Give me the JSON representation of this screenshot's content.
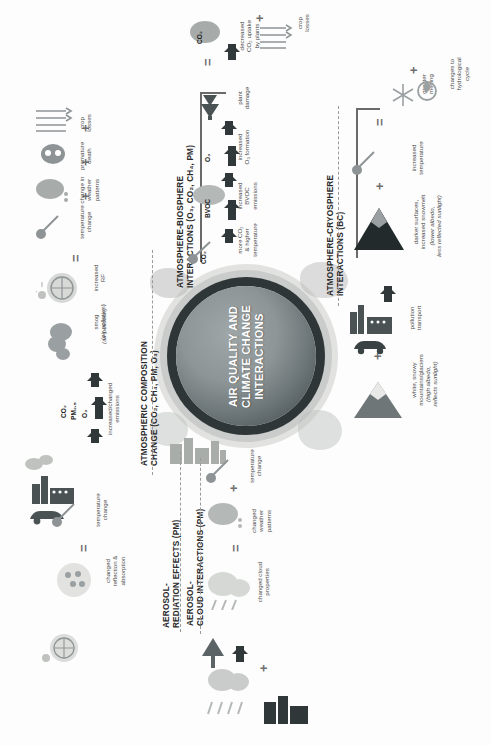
{
  "poster": {
    "center_title": "AIR QUALITY AND\nCLIMATE CHANGE\nINTERACTIONS"
  },
  "sections": [
    {
      "id": "atmospheric-composition",
      "heading": "ATMOSPHERIC COMPOSITION\nCHANGE (CO₂, CH₄, PM, O₃)",
      "tags": [
        "CO₂",
        "PM₂.₅",
        "O₃"
      ],
      "labels": [
        "increased/changed\nemissions",
        "smog\n(air pollution)",
        "increased\nRF",
        "temperature\nchange",
        "change in\nweather\npatterns",
        "premature\ndeath",
        "crop\nlosses"
      ],
      "operators": [
        "+",
        "+",
        "+",
        "="
      ]
    },
    {
      "id": "atmosphere-biosphere",
      "heading": "ATMOSPHERE-BIOSPHERE\nINTERACTIONS (O₃, CO₂, CH₄, PM)",
      "tags": [
        "CO₂",
        "BVOC",
        "O₃"
      ],
      "labels": [
        "more CO₂\n& higher\ntemperature",
        "increased\nBVOC\nemissions",
        "increased\nO₃ formation",
        "plant\ndamage",
        "decreased\nCO₂ uptake\nby plants",
        "crop\nlosses"
      ],
      "operators": [
        "=",
        "+"
      ]
    },
    {
      "id": "atmosphere-cryosphere",
      "heading": "ATMOSPHERE-CRYOSPHERE\nINTERACTIONS (BC)",
      "tags": [],
      "labels": [
        "pollution\ntransport",
        "darker surfaces,\nincreased snowmelt",
        "(lower albedo,\nless reflected sunlight)",
        "increased\ntemperature",
        "greater\nmelting",
        "changes to\nhydrological\ncycle",
        "white, snowy\nmountains/glaciers",
        "(high albedo,\nreflects sunlight)"
      ],
      "operators": [
        "+",
        "+",
        "=",
        "+"
      ]
    },
    {
      "id": "aerosol-radiation",
      "heading": "AEROSOL-\nREDIATION EFFECTS (PM)",
      "tags": [],
      "labels": [
        "changed\nreflection &\nabsorption",
        "temperature\nchange"
      ],
      "operators": [
        "="
      ]
    },
    {
      "id": "aerosol-cloud",
      "heading": "AEROSOL-\nCLOUD INTERACTIONS (PM)",
      "tags": [],
      "labels": [
        "changed cloud\nproperties",
        "changed\nweather\npatterns",
        "temperature\nchange"
      ],
      "operators": [
        "=",
        "+"
      ]
    }
  ],
  "icons": [
    "factory-icon",
    "car-icon",
    "smog-cloud-icon",
    "radiation-globe-icon",
    "thermometer-icon",
    "storm-cloud-icon",
    "skull-icon",
    "wheat-icon",
    "tree-icon",
    "dead-tree-icon",
    "mountain-icon",
    "snowflake-icon",
    "water-drop-icon",
    "sun-reflection-icon",
    "cloud-icon",
    "smoke-plume-icon",
    "city-icon",
    "globe-icon"
  ]
}
